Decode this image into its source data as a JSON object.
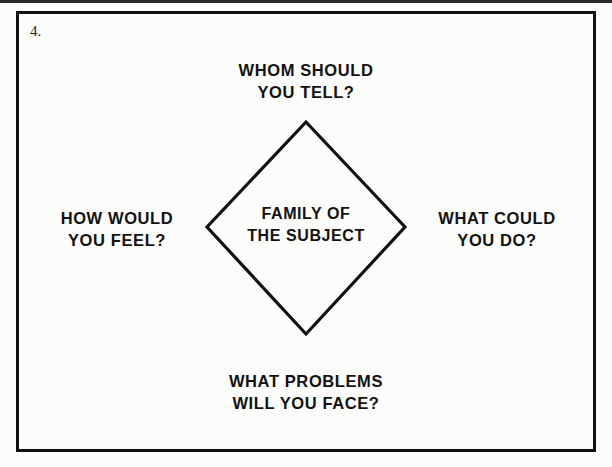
{
  "page": {
    "item_number": "4.",
    "background_color": "#fcfcfb",
    "ink_color": "#121212",
    "frame_color": "#111111"
  },
  "diagram": {
    "type": "diamond-radial",
    "center_label": "FAMILY OF\nTHE SUBJECT",
    "center_label_lines": [
      "FAMILY OF",
      "THE SUBJECT"
    ],
    "nodes": {
      "top": {
        "text": "WHOM SHOULD\nYOU TELL?",
        "lines": [
          "WHOM SHOULD",
          "YOU TELL?"
        ],
        "position": "top"
      },
      "left": {
        "text": "HOW WOULD\nYOU FEEL?",
        "lines": [
          "HOW WOULD",
          "YOU FEEL?"
        ],
        "position": "left"
      },
      "right": {
        "text": "WHAT COULD\nYOU DO?",
        "lines": [
          "WHAT COULD",
          "YOU DO?"
        ],
        "position": "right"
      },
      "bottom": {
        "text": "WHAT PROBLEMS\nWILL YOU FACE?",
        "lines": [
          "WHAT PROBLEMS",
          "WILL YOU FACE?"
        ],
        "position": "bottom"
      }
    },
    "shape": {
      "name": "diamond",
      "stroke_color": "#111111",
      "stroke_width": 3,
      "fill": "none"
    }
  }
}
